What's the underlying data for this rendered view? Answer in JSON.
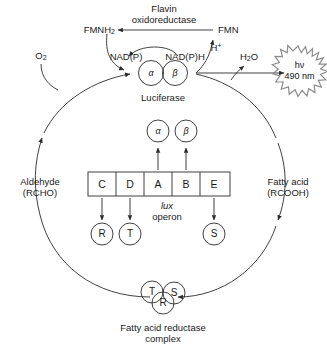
{
  "diagram": {
    "stroke_color": "#2b2b2b",
    "burst_color": "#8c8c8c"
  },
  "top_pathway": {
    "enzyme_line1": "Flavin",
    "enzyme_line2": "oxidoreductase",
    "fmnh2": "FMNH",
    "fmnh2_sub": "2",
    "fmn": "FMN",
    "nadp": "NAD(P)",
    "nadph": "NAD(P)H",
    "proton": "H",
    "proton_sup": "+",
    "oxygen": "O",
    "oxygen_sub": "2",
    "water": "H",
    "water_sub": "2",
    "water_tail": "O"
  },
  "luciferase": {
    "label": "Luciferase",
    "subunit_alpha": "α",
    "subunit_beta": "β"
  },
  "light_emission": {
    "photon": "hν",
    "wavelength": "490 nm"
  },
  "cycle_labels": {
    "aldehyde_line1": "Aldehyde",
    "aldehyde_line2": "(RCHO)",
    "fatty_acid_line1": "Fatty acid",
    "fatty_acid_line2": "(RCOOH)"
  },
  "operon": {
    "name_italic": "lux",
    "name_rest": "operon",
    "genes": [
      {
        "letter": "C"
      },
      {
        "letter": "D"
      },
      {
        "letter": "A"
      },
      {
        "letter": "B"
      },
      {
        "letter": "E"
      }
    ],
    "products": [
      {
        "letter": "R"
      },
      {
        "letter": "T"
      },
      {
        "letter": "S"
      }
    ],
    "subunits": [
      {
        "letter": "α"
      },
      {
        "letter": "β"
      }
    ]
  },
  "reductase_complex": {
    "caption_line1": "Fatty acid reductase",
    "caption_line2": "complex",
    "units": [
      {
        "letter": "T"
      },
      {
        "letter": "S"
      },
      {
        "letter": "R"
      }
    ]
  }
}
